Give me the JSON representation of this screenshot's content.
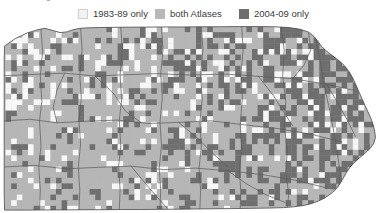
{
  "figure": {
    "clipped_caption": "Atlas change",
    "clipped_symbol": "■"
  },
  "legend": {
    "position": "top",
    "items": [
      {
        "label": "1983-89 only",
        "color": "#f2f2f2",
        "name": "legend-1983-89-only"
      },
      {
        "label": "both Atlases",
        "color": "#b8b8b8",
        "name": "legend-both-atlases"
      },
      {
        "label": "2004-09 only",
        "color": "#6e6e6e",
        "name": "legend-2004-09-only"
      }
    ]
  },
  "map": {
    "title": "Pennsylvania breeding bird atlas block comparison",
    "region": "Pennsylvania",
    "background": "#ffffff",
    "border_color": "#4b4b4b",
    "county_line_color": "#5a5a5a",
    "grid": {
      "cell_px": 5.6,
      "cols": 68,
      "rows": 34,
      "categories": [
        "1983-89 only",
        "both Atlases",
        "2004-09 only"
      ],
      "category_colors": [
        "#f7f7f7",
        "#b6b6b6",
        "#6f6f6f"
      ],
      "approx_shares": [
        0.13,
        0.58,
        0.29
      ]
    }
  },
  "chart_data": {
    "type": "heatmap",
    "xlabel": "",
    "ylabel": "",
    "categories": [
      "1983-89 only",
      "both Atlases",
      "2004-09 only"
    ],
    "values": [
      13,
      58,
      29
    ],
    "legend_position": "top",
    "grid": false
  }
}
